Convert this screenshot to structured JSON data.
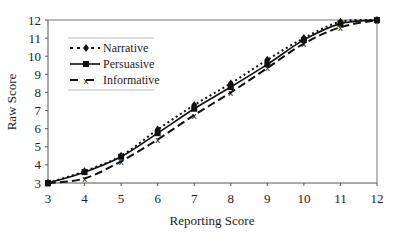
{
  "chart_data": {
    "type": "line",
    "title": "",
    "xlabel": "Reporting Score",
    "ylabel": "Raw Score",
    "xlim": [
      3,
      12
    ],
    "ylim": [
      3,
      12
    ],
    "x_ticks": [
      "3",
      "4",
      "5",
      "6",
      "7",
      "8",
      "9",
      "10",
      "11",
      "12"
    ],
    "y_ticks": [
      "3",
      "4",
      "5",
      "6",
      "7",
      "8",
      "9",
      "10",
      "11",
      "12"
    ],
    "grid": false,
    "legend_position": "top-left",
    "x": [
      3,
      4,
      5,
      6,
      7,
      8,
      9,
      10,
      11,
      12
    ],
    "series": [
      {
        "name": "Narrative",
        "style": "dotted",
        "marker": "diamond",
        "values": [
          3.0,
          3.65,
          4.5,
          5.95,
          7.3,
          8.5,
          9.8,
          11.0,
          11.9,
          12.0
        ]
      },
      {
        "name": "Persuasive",
        "style": "solid",
        "marker": "square",
        "values": [
          3.0,
          3.6,
          4.45,
          5.75,
          7.1,
          8.3,
          9.55,
          10.9,
          11.8,
          12.0
        ]
      },
      {
        "name": "Informative",
        "style": "dashed",
        "marker": "x",
        "values": [
          3.0,
          3.25,
          4.2,
          5.4,
          6.75,
          8.0,
          9.35,
          10.7,
          11.6,
          12.0
        ]
      }
    ]
  }
}
